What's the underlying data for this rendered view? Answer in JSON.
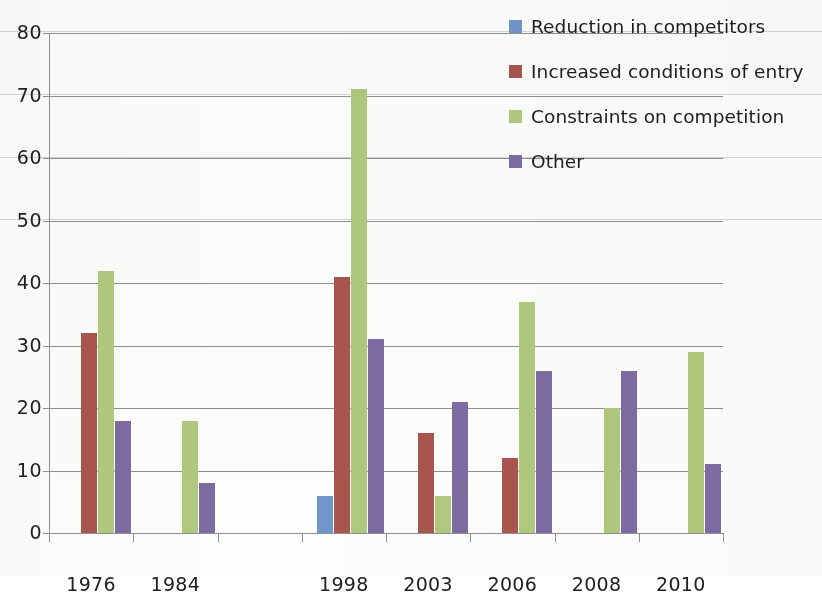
{
  "chart_data": {
    "type": "bar",
    "title": "",
    "subtitle": "",
    "xlabel": "",
    "ylabel": "",
    "ylim": [
      0,
      80
    ],
    "y_ticks": [
      0,
      10,
      20,
      30,
      40,
      50,
      60,
      70,
      80
    ],
    "grid": true,
    "legend_position": "top-right",
    "categories": [
      "1976",
      "1984",
      "",
      "1998",
      "2003",
      "2006",
      "2008",
      "2010"
    ],
    "series": [
      {
        "name": "Reduction in competitors",
        "color": "#7196C9",
        "values": [
          null,
          null,
          null,
          6,
          null,
          null,
          null,
          null
        ]
      },
      {
        "name": "Increased conditions of entry",
        "color": "#A9564D",
        "values": [
          32,
          null,
          null,
          41,
          16,
          12,
          null,
          null
        ]
      },
      {
        "name": "Constraints on competition",
        "color": "#B1C97E",
        "values": [
          42,
          18,
          null,
          71,
          6,
          37,
          20,
          29
        ]
      },
      {
        "name": "Other",
        "color": "#7D6CA1",
        "values": [
          18,
          8,
          null,
          31,
          21,
          26,
          26,
          11
        ]
      }
    ]
  },
  "legend": {
    "items": [
      {
        "label": "Reduction in competitors",
        "color": "#7196C9"
      },
      {
        "label": "Increased conditions of entry",
        "color": "#A9564D"
      },
      {
        "label": "Constraints on competition",
        "color": "#B1C97E"
      },
      {
        "label": "Other",
        "color": "#7D6CA1"
      }
    ]
  },
  "axes": {
    "y_tick_labels": [
      "80",
      "70",
      "60",
      "50",
      "40",
      "30",
      "20",
      "10",
      "0"
    ],
    "x_tick_labels": [
      "1976",
      "1984",
      "",
      "1998",
      "2003",
      "2006",
      "2008",
      "2010"
    ]
  }
}
